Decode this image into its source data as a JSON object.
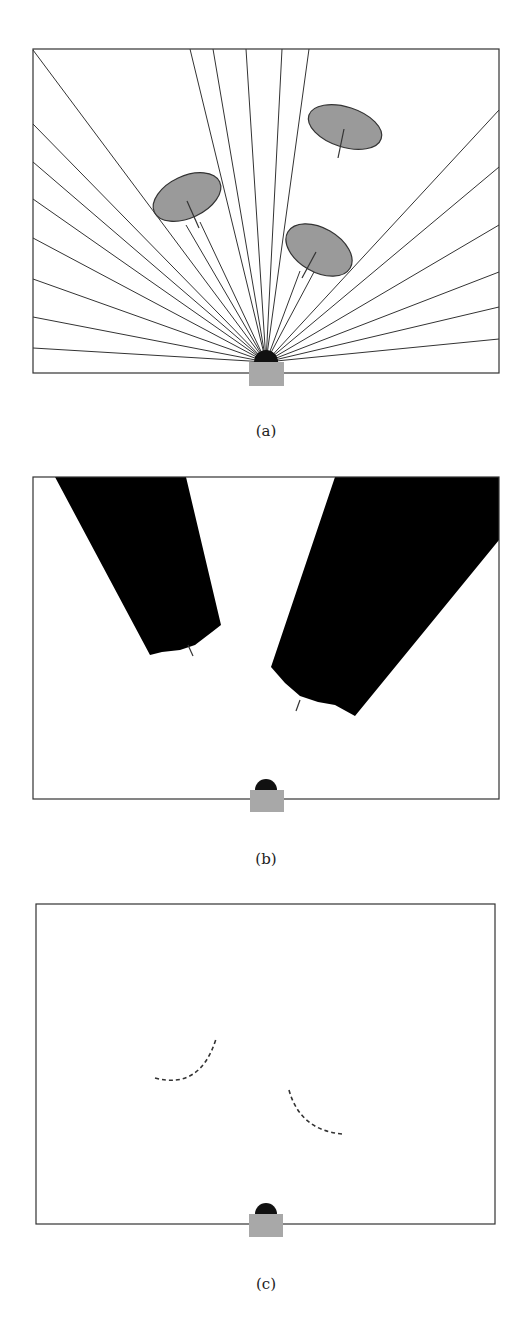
{
  "figure": {
    "panels": [
      {
        "id": "a",
        "caption": "(a)",
        "description": "Range sensor casting rays; three obstacles (ellipses) block rays",
        "frame": {
          "x": 33,
          "y": 49,
          "w": 466,
          "h": 324
        },
        "sensor": {
          "x": 249,
          "y": 362,
          "w": 35,
          "h": 24,
          "dome_cx": 266,
          "dome_cy": 362,
          "dome_r": 12
        },
        "rays_to_edges": [
          [
            33,
            50
          ],
          [
            33,
            124
          ],
          [
            33,
            162
          ],
          [
            33,
            199
          ],
          [
            33,
            238
          ],
          [
            33,
            279
          ],
          [
            33,
            317
          ],
          [
            33,
            348
          ],
          [
            190,
            49
          ],
          [
            213,
            49
          ],
          [
            246,
            49
          ],
          [
            282,
            49
          ],
          [
            309,
            49
          ],
          [
            499,
            110
          ],
          [
            499,
            167
          ],
          [
            499,
            225
          ],
          [
            499,
            272
          ],
          [
            499,
            307
          ],
          [
            499,
            339
          ]
        ],
        "rays_to_obstacles": [
          [
            186,
            225
          ],
          [
            200,
            222
          ],
          [
            300,
            271
          ],
          [
            314,
            272
          ]
        ],
        "obstacles": [
          {
            "cx": 187,
            "cy": 197,
            "rx": 36,
            "ry": 21,
            "rot": -25,
            "tick": [
              [
                187,
                201
              ],
              [
                199,
                228
              ]
            ]
          },
          {
            "cx": 345,
            "cy": 127,
            "rx": 38,
            "ry": 20,
            "rot": 18,
            "tick": [
              [
                344,
                129
              ],
              [
                338,
                158
              ]
            ]
          },
          {
            "cx": 319,
            "cy": 250,
            "rx": 36,
            "ry": 22,
            "rot": 30,
            "tick": [
              [
                316,
                252
              ],
              [
                302,
                278
              ]
            ]
          }
        ]
      },
      {
        "id": "b",
        "caption": "(b)",
        "description": "Occluded (shadow) regions behind obstacles",
        "frame": {
          "x": 33,
          "y": 477,
          "w": 466,
          "h": 322
        },
        "sensor": {
          "x": 250,
          "y": 790,
          "w": 34,
          "h": 22,
          "dome_cx": 266,
          "dome_cy": 790,
          "dome_r": 11
        },
        "shadows": [
          "55,477 186,477 221,625 212,632 195,645 180,650 162,652 150,655",
          "335,477 499,477 499,540 355,716 335,705 318,702 300,696 285,683 271,667"
        ],
        "ticks": [
          [
            [
              188,
              645
            ],
            [
              193,
              656
            ]
          ],
          [
            [
              300,
              700
            ],
            [
              296,
              711
            ]
          ]
        ]
      },
      {
        "id": "c",
        "caption": "(c)",
        "description": "Visible obstacle boundaries as dashed arcs",
        "frame": {
          "x": 36,
          "y": 904,
          "w": 459,
          "h": 320
        },
        "sensor": {
          "x": 249,
          "y": 1214,
          "w": 34,
          "h": 23,
          "dome_cx": 266,
          "dome_cy": 1214,
          "dome_r": 11
        },
        "arcs": [
          "M155,1078 Q200,1090 216,1039",
          "M289,1090 Q300,1130 342,1134"
        ]
      }
    ],
    "colors": {
      "line": "#333333",
      "obstacle_fill": "#9a9a9a",
      "sensor_body": "#a8a8a8",
      "dome": "#111111",
      "shadow": "#000000"
    }
  }
}
